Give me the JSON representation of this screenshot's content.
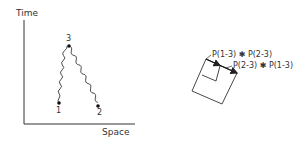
{
  "left_diagram": {
    "y_axis_label": "Time",
    "x_axis_label": "Space",
    "points": [
      {
        "id": "1",
        "label": "1"
      },
      {
        "id": "2",
        "label": "2"
      },
      {
        "id": "3",
        "label": "3"
      }
    ]
  },
  "right_diagram": {
    "vector_labels": [
      "P(1-3) ✱ P(2-3)",
      "P(2-3) ✱ P(1-3)"
    ]
  },
  "colors": {
    "ink": "#222222",
    "background": "#ffffff"
  }
}
